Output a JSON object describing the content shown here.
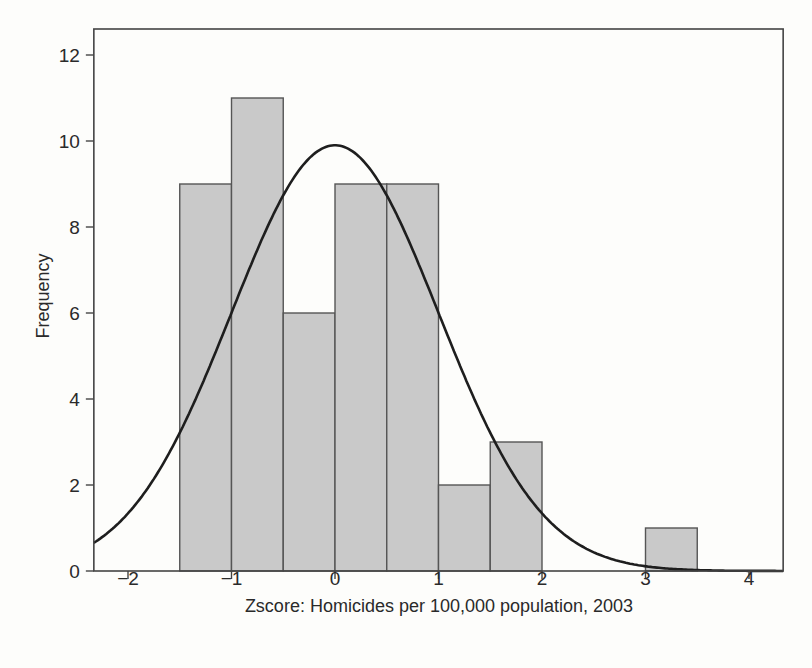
{
  "chart_data": {
    "type": "bar",
    "subtype": "histogram_with_normal_curve",
    "title": "",
    "xlabel": "Zscore: Homicides per 100,000 population, 2003",
    "ylabel": "Frequency",
    "xlim": [
      -2.33,
      4.33
    ],
    "ylim": [
      0,
      12.4
    ],
    "xticks": [
      -2,
      -1,
      0,
      1,
      2,
      3,
      4
    ],
    "xtick_labels": [
      "−2",
      "−1",
      "0",
      "1",
      "2",
      "3",
      "4"
    ],
    "yticks": [
      0,
      2,
      4,
      6,
      8,
      10,
      12
    ],
    "ytick_labels": [
      "0",
      "2",
      "4",
      "6",
      "8",
      "10",
      "12"
    ],
    "grid": false,
    "bin_width": 0.5,
    "bins": [
      {
        "start": -1.5,
        "end": -1.0,
        "count": 9
      },
      {
        "start": -1.0,
        "end": -0.5,
        "count": 11
      },
      {
        "start": -0.5,
        "end": 0.0,
        "count": 6
      },
      {
        "start": 0.0,
        "end": 0.5,
        "count": 9
      },
      {
        "start": 0.5,
        "end": 1.0,
        "count": 9
      },
      {
        "start": 1.0,
        "end": 1.5,
        "count": 2
      },
      {
        "start": 1.5,
        "end": 2.0,
        "count": 3
      },
      {
        "start": 3.0,
        "end": 3.5,
        "count": 1
      }
    ],
    "categories": [
      "-1.5 to -1.0",
      "-1.0 to -0.5",
      "-0.5 to 0.0",
      "0.0 to 0.5",
      "0.5 to 1.0",
      "1.0 to 1.5",
      "1.5 to 2.0",
      "3.0 to 3.5"
    ],
    "values": [
      9,
      11,
      6,
      9,
      9,
      2,
      3,
      1
    ],
    "overlay": {
      "type": "line",
      "name": "normal curve",
      "mean": 0,
      "sd": 1,
      "peak": 9.9
    },
    "colors": {
      "bar_fill": "#c9c9c9",
      "bar_edge": "#555555",
      "curve": "#1e1e1e",
      "frame": "#444444"
    }
  }
}
